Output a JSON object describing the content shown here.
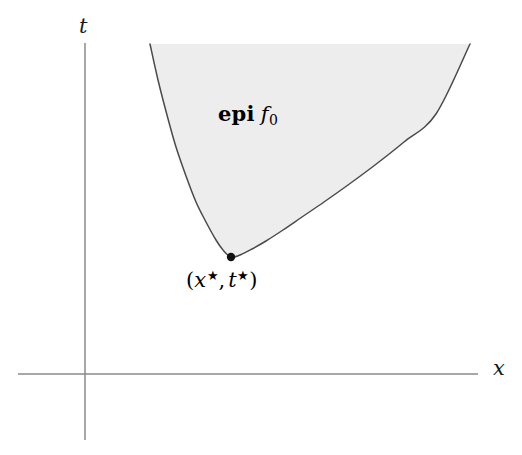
{
  "figure": {
    "kind": "epigraph-diagram",
    "background_color": "#ffffff",
    "axes": {
      "vertical": {
        "label": "t",
        "name": "t-axis",
        "color": "#8a8a8a",
        "x": 85,
        "y_top": 43,
        "y_bottom": 440
      },
      "horizontal": {
        "label": "x",
        "name": "x-axis",
        "color": "#8a8a8a",
        "y": 374,
        "x_left": 18,
        "x_right": 478
      }
    },
    "region": {
      "label_bold": "epi",
      "label_fn": "f",
      "label_fn_subscript": "0",
      "fill_color": "#ededed",
      "stroke_color": "#4a4a4a"
    },
    "point": {
      "label_open_paren": "(",
      "label_x_var": "x",
      "label_x_star": "★",
      "label_comma": ",",
      "label_t_var": "t",
      "label_t_star": "★",
      "label_close_paren": ")",
      "marker_color": "#111111",
      "marker_x": 231,
      "marker_y": 257,
      "marker_radius": 4.2
    }
  },
  "chart_data": {
    "type": "area",
    "title": "",
    "subtitle": "",
    "xlabel": "x",
    "ylabel": "t",
    "grid": false,
    "legend": null,
    "axis_origin_px": [
      85,
      374
    ],
    "xlim_px": [
      18,
      478
    ],
    "ylim_px": [
      440,
      43
    ],
    "annotations": [
      {
        "text": "epi f0",
        "x_px": 255,
        "y_px": 118,
        "kind": "region-label"
      },
      {
        "text": "(x*, t*)",
        "x_px": 233,
        "y_px": 285,
        "kind": "point-label"
      },
      {
        "text": "t",
        "x_px": 88,
        "y_px": 27,
        "kind": "axis-label"
      },
      {
        "text": "x",
        "x_px": 499,
        "y_px": 369,
        "kind": "axis-label"
      }
    ],
    "series": [
      {
        "name": "f0 (convex curve, boundary of epigraph)",
        "x": [
          150,
          158,
          167,
          176,
          186,
          196,
          206,
          216,
          223,
          231,
          240,
          252,
          266,
          283,
          302,
          324,
          348,
          375,
          404,
          436,
          470
        ],
        "y": [
          44,
          80,
          115,
          147,
          176,
          202,
          222,
          240,
          250,
          257,
          255,
          249,
          241,
          230,
          217,
          202,
          185,
          165,
          142,
          114,
          44
        ]
      }
    ],
    "region_fill": {
      "name": "epi f0",
      "color": "#ededed",
      "top_edge_y_px": 44,
      "left_x_px": 150,
      "right_x_px": 470
    },
    "points": [
      {
        "name": "(x*, t*)",
        "x_px": 231,
        "y_px": 257,
        "color": "#111111"
      }
    ]
  }
}
